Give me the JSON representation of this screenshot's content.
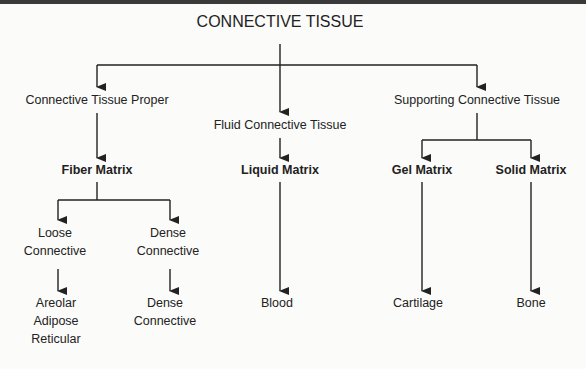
{
  "diagram": {
    "title": "CONNECTIVE TISSUE",
    "level1": [
      {
        "label": "Connective Tissue Proper"
      },
      {
        "label": "Fluid Connective Tissue"
      },
      {
        "label": "Supporting Connective Tissue"
      }
    ],
    "level2": [
      {
        "label": "Fiber Matrix"
      },
      {
        "label": "Liquid Matrix"
      },
      {
        "label": "Gel Matrix"
      },
      {
        "label": "Solid Matrix"
      }
    ],
    "fiber_children": [
      {
        "line1": "Loose",
        "line2": "Connective"
      },
      {
        "line1": "Dense",
        "line2": "Connective"
      }
    ],
    "leaves": {
      "loose": [
        "Areolar",
        "Adipose",
        "Reticular"
      ],
      "dense": [
        "Dense",
        "Connective"
      ],
      "liquid": "Blood",
      "gel": "Cartilage",
      "solid": "Bone"
    },
    "colors": {
      "line": "#222222",
      "background": "#fbfbf9"
    }
  }
}
